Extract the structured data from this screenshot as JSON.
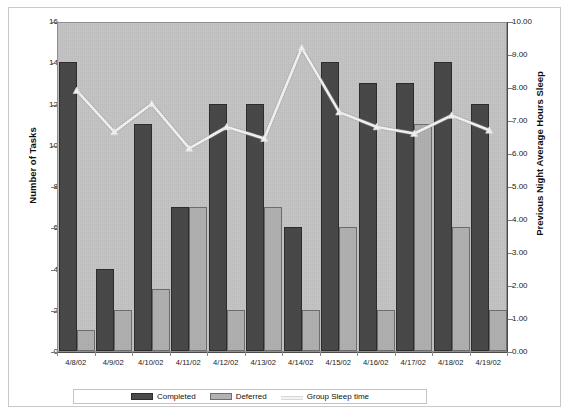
{
  "chart_data": {
    "type": "bar",
    "title": "",
    "subtitle": "",
    "xlabel": "",
    "ylabel": "Number of Tasks",
    "y2label": "Previous Night Average Hours Sleep",
    "ylim": [
      0,
      16
    ],
    "y2lim": [
      0,
      10
    ],
    "grid": false,
    "legend_position": "bottom",
    "categories": [
      "4/8/02",
      "4/9/02",
      "4/10/02",
      "4/11/02",
      "4/12/02",
      "4/13/02",
      "4/14/02",
      "4/15/02",
      "4/16/02",
      "4/17/02",
      "4/18/02",
      "4/19/02"
    ],
    "series": [
      {
        "name": "Completed",
        "type": "bar",
        "axis": "left",
        "color": "#4a4a4a",
        "values": [
          14,
          4,
          11,
          7,
          12,
          12,
          6,
          14,
          13,
          13,
          14,
          12
        ]
      },
      {
        "name": "Deferred",
        "type": "bar",
        "axis": "left",
        "color": "#b2b2b2",
        "values": [
          1,
          2,
          3,
          7,
          2,
          7,
          2,
          6,
          2,
          11,
          6,
          2
        ]
      },
      {
        "name": "Group Sleep time",
        "type": "line",
        "axis": "right",
        "color": "#f5f5f5",
        "values": [
          7.95,
          6.7,
          7.55,
          6.2,
          6.85,
          6.5,
          9.25,
          7.3,
          6.85,
          6.65,
          7.2,
          6.75
        ]
      }
    ],
    "left_ticks": [
      "16",
      "14",
      "12",
      "10",
      "8",
      "6",
      "4",
      "2",
      "0"
    ],
    "left_tick_values": [
      16,
      14,
      12,
      10,
      8,
      6,
      4,
      2,
      0
    ],
    "right_ticks": [
      "10.00",
      "9.00",
      "8.00",
      "7.00",
      "6.00",
      "5.00",
      "4.00",
      "3.00",
      "2.00",
      "1.00",
      "0.00"
    ],
    "right_tick_values": [
      10,
      9,
      8,
      7,
      6,
      5,
      4,
      3,
      2,
      1,
      0
    ]
  },
  "legend": {
    "completed_label": "Completed",
    "deferred_label": "Deferred",
    "sleep_label": "Group Sleep time"
  },
  "axes": {
    "left_title": "Number of Tasks",
    "right_title": "Previous Night Average Hours Sleep"
  },
  "colors": {
    "plot_background": "#c6c6c6",
    "completed": "#4a4a4a",
    "deferred": "#b2b2b2",
    "sleep_line": "#f5f5f5",
    "page_background": "#ffffff"
  }
}
